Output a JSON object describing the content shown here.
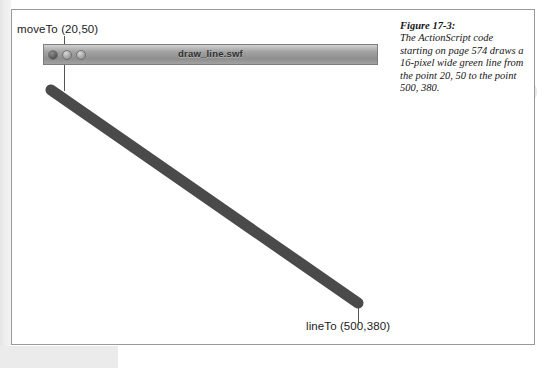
{
  "figure": {
    "caption_title": "Figure 17-3:",
    "caption_body": "The ActionScript code starting on page 574 draws a 16-pixel wide green line from the point 20, 50 to the point 500, 380."
  },
  "window": {
    "title": "draw_line.swf",
    "controls": [
      {
        "name": "close",
        "label": "close"
      },
      {
        "name": "minimize",
        "label": "minimize"
      },
      {
        "name": "zoom",
        "label": "zoom"
      }
    ]
  },
  "annotations": {
    "start_label": "moveTo (20,50)",
    "end_label": "lineTo (500,380)"
  },
  "drawing": {
    "line_color": "#4a4a4a",
    "line_width_px": 16,
    "start_point": {
      "x": 20,
      "y": 50
    },
    "end_point": {
      "x": 500,
      "y": 380
    }
  },
  "colors": {
    "page_background": "#ffffff",
    "figure_border": "#9a9a9a",
    "title_bar": "#9c9c9c",
    "leader_line": "#555555"
  }
}
